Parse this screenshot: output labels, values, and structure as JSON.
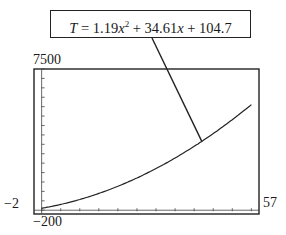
{
  "chart_data": {
    "type": "line",
    "title": "",
    "equation": {
      "var": "T",
      "a": "1.19",
      "b": "34.61",
      "c": "104.7",
      "text": "T = 1.19x^2 + 34.61x + 104.7"
    },
    "window": {
      "xmin": -2,
      "xmax": 57,
      "ymin": -200,
      "ymax": 7500
    },
    "tick_labels": {
      "ymax": "7500",
      "xmin": "−2",
      "xmax": "57",
      "ymin": "−200"
    },
    "series": [
      {
        "name": "T = 1.19x^2 + 34.61x + 104.7",
        "x": [
          0,
          10,
          20,
          30,
          40,
          50,
          55
        ],
        "y": [
          104.7,
          569.8,
          1272.9,
          2214.0,
          3393.1,
          4810.2,
          5619.8
        ]
      }
    ],
    "axes": {
      "x_ticks_every": 5,
      "y_ticks_every": 500
    },
    "grid": false,
    "legend": "callout box with leader line pointing to curve"
  }
}
